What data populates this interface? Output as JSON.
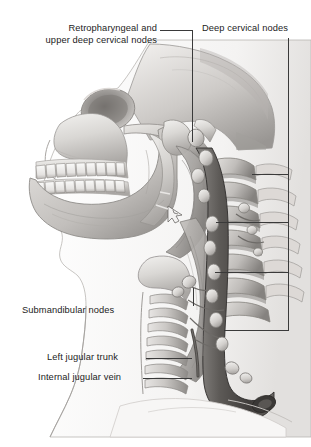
{
  "figure": {
    "background_color": "#ffffff",
    "line_color": "#3a3a3a",
    "text_color": "#1c1c1c",
    "width": 311,
    "height": 447
  },
  "labels": [
    {
      "id": "retropharyngeal",
      "name": "retropharyngeal-and-upper-deep-cervical-nodes",
      "line1": "Retropharyngeal and",
      "line2": "upper deep cervical nodes",
      "x": 56,
      "y": 23,
      "align": "right"
    },
    {
      "id": "deep-cervical",
      "name": "deep-cervical-nodes",
      "line1": "Deep cervical nodes",
      "line2": "",
      "x": 202,
      "y": 23,
      "align": "left"
    },
    {
      "id": "submandibular",
      "name": "submandibular-nodes",
      "line1": "Submandibular nodes",
      "line2": "",
      "x": 22,
      "y": 305,
      "align": "left"
    },
    {
      "id": "left-jugular-trunk",
      "name": "left-jugular-trunk",
      "line1": "Left jugular trunk",
      "line2": "",
      "x": 47,
      "y": 352,
      "align": "left"
    },
    {
      "id": "internal-jugular-vein",
      "name": "internal-jugular-vein",
      "line1": "Internal jugular vein",
      "line2": "",
      "x": 38,
      "y": 372,
      "align": "left"
    }
  ],
  "leaders": [
    {
      "name": "leader-retropharyngeal-horizontal",
      "type": "h",
      "x": 160,
      "y": 30,
      "len": 32
    },
    {
      "name": "leader-retropharyngeal-vertical",
      "type": "v",
      "x": 192,
      "y": 30,
      "len": 182
    },
    {
      "name": "leader-deep-cervical-vertical",
      "type": "v",
      "x": 288,
      "y": 38,
      "len": 292
    },
    {
      "name": "leader-deep-cervical-branch-1",
      "type": "h",
      "x": 252,
      "y": 174,
      "len": 37
    },
    {
      "name": "leader-deep-cervical-branch-2",
      "type": "h",
      "x": 216,
      "y": 222,
      "len": 73
    },
    {
      "name": "leader-deep-cervical-branch-3",
      "type": "h",
      "x": 215,
      "y": 272,
      "len": 74
    },
    {
      "name": "leader-deep-cervical-branch-4",
      "type": "h",
      "x": 224,
      "y": 330,
      "len": 65
    },
    {
      "name": "leader-submandibular-vertical",
      "type": "v",
      "x": 193,
      "y": 288,
      "len": 18
    },
    {
      "name": "leader-left-jugular-trunk",
      "type": "h",
      "x": 146,
      "y": 358,
      "len": 46
    },
    {
      "name": "leader-internal-jugular-vein",
      "type": "h",
      "x": 143,
      "y": 378,
      "len": 49
    }
  ],
  "illustration": {
    "description": "Grayscale medical illustration: lateral view of skull, mandible with teeth, cervical vertebrae, pharynx, trachea, sternocleidomastoid, internal jugular vein and chains of lymph nodes",
    "parts": [
      "cranium",
      "zygomatic-arch",
      "maxilla",
      "mandible",
      "upper-teeth",
      "lower-teeth",
      "hyoid",
      "thyroid-cartilage",
      "trachea",
      "cervical-vertebrae",
      "internal-jugular-vein",
      "jugular-trunk",
      "lymph-node-chain",
      "sternocleidomastoid",
      "clavicle"
    ]
  }
}
